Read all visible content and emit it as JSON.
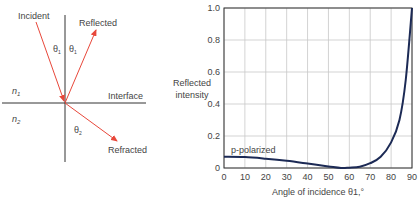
{
  "diagram": {
    "labels": {
      "incident": "Incident",
      "reflected": "Reflected",
      "refracted": "Refracted",
      "interface": "Interface",
      "n1": "n",
      "n1_sub": "1",
      "n2": "n",
      "n2_sub": "2",
      "theta1_left": "θ",
      "theta1_left_sub": "1",
      "theta1_right": "θ",
      "theta1_right_sub": "1",
      "theta2": "θ",
      "theta2_sub": "2"
    },
    "colors": {
      "ray": "#e8473a",
      "axis": "#333333"
    }
  },
  "chart_data": {
    "type": "line",
    "title": "",
    "xlabel": "Angle of incidence θ1,°",
    "ylabel": "Reflected intensity",
    "xlim": [
      0,
      90
    ],
    "ylim": [
      0,
      1.0
    ],
    "grid": true,
    "x_ticks": [
      "0",
      "10",
      "20",
      "30",
      "40",
      "50",
      "60",
      "70",
      "80",
      "90"
    ],
    "y_ticks": [
      "0",
      "0.2",
      "0.4",
      "0.6",
      "0.8",
      "1.0"
    ],
    "series": [
      {
        "name": "p-polarized",
        "color": "#1c2a55",
        "x": [
          0,
          10,
          20,
          30,
          40,
          50,
          56,
          60,
          65,
          70,
          75,
          80,
          84,
          87,
          90
        ],
        "y": [
          0.07,
          0.068,
          0.058,
          0.045,
          0.028,
          0.01,
          0.0,
          0.002,
          0.008,
          0.03,
          0.07,
          0.16,
          0.3,
          0.55,
          1.0
        ]
      }
    ],
    "annotations": [
      {
        "text": "p-polarized",
        "x": 18,
        "y": 0.1
      }
    ]
  }
}
